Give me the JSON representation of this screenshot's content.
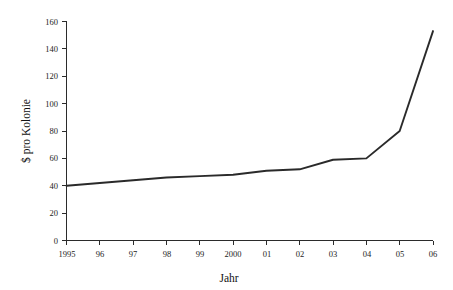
{
  "chart_data": {
    "type": "line",
    "title": "",
    "subtitle": "",
    "xlabel": "Jahr",
    "ylabel": "$ pro Kolonie",
    "grid": false,
    "legend": false,
    "legend_position": "none",
    "line_color": "#2a2a2a",
    "background_color": "#ffffff",
    "x": [
      1995,
      1996,
      1997,
      1998,
      1999,
      2000,
      2001,
      2002,
      2003,
      2004,
      2005,
      2006
    ],
    "categories": [
      "1995",
      "96",
      "97",
      "98",
      "99",
      "2000",
      "01",
      "02",
      "03",
      "04",
      "05",
      "06"
    ],
    "values": [
      40,
      42,
      44,
      46,
      47,
      48,
      51,
      52,
      59,
      60,
      80,
      153
    ],
    "series": [
      {
        "name": "$ pro Kolonie",
        "values": [
          40,
          42,
          44,
          46,
          47,
          48,
          51,
          52,
          59,
          60,
          80,
          153
        ]
      }
    ],
    "xlim": [
      1995,
      2006
    ],
    "ylim": [
      0,
      160
    ],
    "xticks": [
      1995,
      1996,
      1997,
      1998,
      1999,
      2000,
      2001,
      2002,
      2003,
      2004,
      2005,
      2006
    ],
    "xtick_labels": [
      "1995",
      "96",
      "97",
      "98",
      "99",
      "2000",
      "01",
      "02",
      "03",
      "04",
      "05",
      "06"
    ],
    "yticks": [
      0,
      20,
      40,
      60,
      80,
      100,
      120,
      140,
      160
    ],
    "ytick_labels": [
      "0",
      "20",
      "40",
      "60",
      "80",
      "100",
      "120",
      "140",
      "160"
    ]
  },
  "axes": {
    "y_title": "$ pro Kolonie",
    "x_title": "Jahr"
  },
  "y_ticks": [
    {
      "label": "160"
    },
    {
      "label": "140"
    },
    {
      "label": "120"
    },
    {
      "label": "100"
    },
    {
      "label": "80"
    },
    {
      "label": "60"
    },
    {
      "label": "40"
    },
    {
      "label": "20"
    },
    {
      "label": "0"
    }
  ],
  "x_ticks": [
    {
      "label": "1995"
    },
    {
      "label": "96"
    },
    {
      "label": "97"
    },
    {
      "label": "98"
    },
    {
      "label": "99"
    },
    {
      "label": "2000"
    },
    {
      "label": "01"
    },
    {
      "label": "02"
    },
    {
      "label": "03"
    },
    {
      "label": "04"
    },
    {
      "label": "05"
    },
    {
      "label": "06"
    }
  ]
}
